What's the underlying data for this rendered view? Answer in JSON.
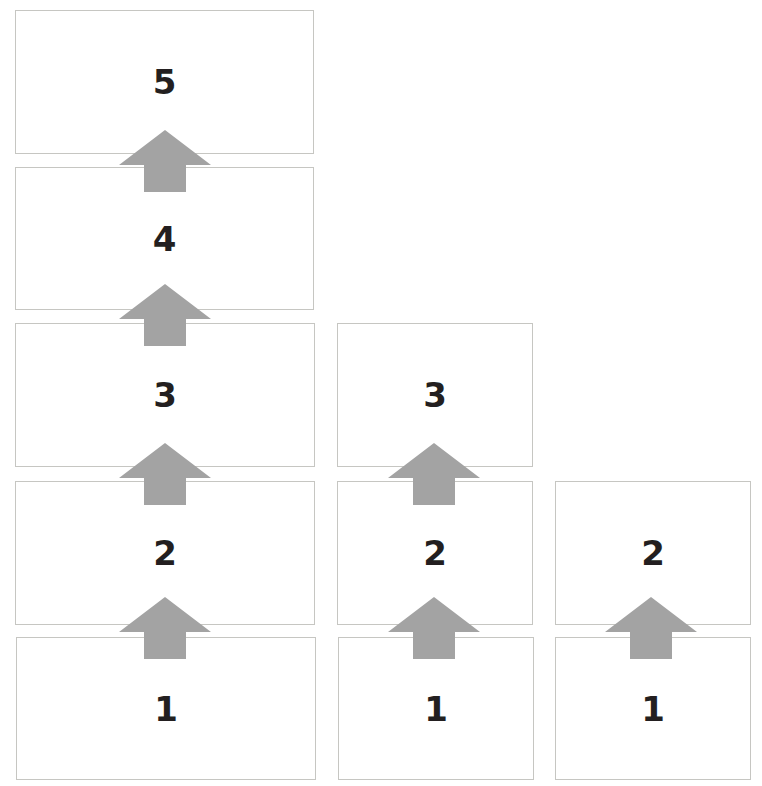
{
  "diagram": {
    "title": "",
    "colors": {
      "arrow": "#a3a3a3",
      "border": "#c6c6c2",
      "text": "#231f20"
    },
    "columns": [
      {
        "id": "col-1",
        "boxes": [
          {
            "label": "5",
            "x": 15,
            "y": 10,
            "w": 299,
            "h": 144
          },
          {
            "label": "4",
            "x": 15,
            "y": 167,
            "w": 299,
            "h": 143
          },
          {
            "label": "3",
            "x": 15,
            "y": 323,
            "w": 300,
            "h": 144
          },
          {
            "label": "2",
            "x": 15,
            "y": 481,
            "w": 300,
            "h": 144
          },
          {
            "label": "1",
            "x": 16,
            "y": 637,
            "w": 300,
            "h": 143
          }
        ]
      },
      {
        "id": "col-2",
        "boxes": [
          {
            "label": "3",
            "x": 337,
            "y": 323,
            "w": 196,
            "h": 144
          },
          {
            "label": "2",
            "x": 337,
            "y": 481,
            "w": 196,
            "h": 144
          },
          {
            "label": "1",
            "x": 338,
            "y": 637,
            "w": 196,
            "h": 143
          }
        ]
      },
      {
        "id": "col-3",
        "boxes": [
          {
            "label": "2",
            "x": 555,
            "y": 481,
            "w": 196,
            "h": 144
          },
          {
            "label": "1",
            "x": 555,
            "y": 637,
            "w": 196,
            "h": 143
          }
        ]
      }
    ],
    "arrows": [
      {
        "direction": "up",
        "from": "4",
        "to": "5",
        "x": 119,
        "y": 130
      },
      {
        "direction": "up",
        "from": "3",
        "to": "4",
        "x": 119,
        "y": 284
      },
      {
        "direction": "up",
        "from": "2",
        "to": "3",
        "x": 119,
        "y": 443
      },
      {
        "direction": "up",
        "from": "1",
        "to": "2",
        "x": 119,
        "y": 597
      },
      {
        "direction": "up",
        "from": "2",
        "to": "3",
        "x": 388,
        "y": 443
      },
      {
        "direction": "up",
        "from": "1",
        "to": "2",
        "x": 388,
        "y": 597
      },
      {
        "direction": "up",
        "from": "1",
        "to": "2",
        "x": 605,
        "y": 597
      }
    ]
  },
  "labels": {
    "c1_5": "5",
    "c1_4": "4",
    "c1_3": "3",
    "c1_2": "2",
    "c1_1": "1",
    "c2_3": "3",
    "c2_2": "2",
    "c2_1": "1",
    "c3_2": "2",
    "c3_1": "1"
  }
}
